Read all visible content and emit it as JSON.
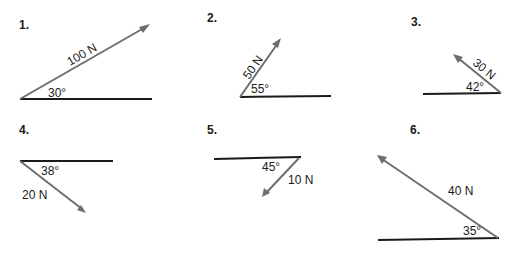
{
  "colors": {
    "baseline": "#1a1a1a",
    "vector": "#6e6e6e",
    "text": "#1a1a1a"
  },
  "problems": [
    {
      "number": "1.",
      "force": "100 N",
      "angle": "30°"
    },
    {
      "number": "2.",
      "force": "50 N",
      "angle": "55°"
    },
    {
      "number": "3.",
      "force": "30 N",
      "angle": "42°"
    },
    {
      "number": "4.",
      "force": "20 N",
      "angle": "38°"
    },
    {
      "number": "5.",
      "force": "10 N",
      "angle": "45°"
    },
    {
      "number": "6.",
      "force": "40 N",
      "angle": "35°"
    }
  ]
}
